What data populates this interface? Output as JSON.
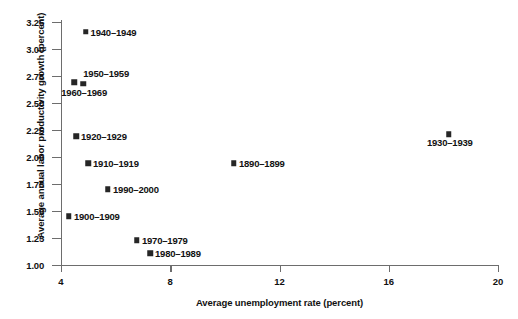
{
  "chart_data": {
    "type": "scatter",
    "title": "",
    "xlabel": "Average unemployment rate (percent)",
    "ylabel": "Average annual labor productivity growth (percent)",
    "xlim": [
      4,
      20
    ],
    "ylim": [
      1.0,
      3.25
    ],
    "xticks": [
      "4",
      "8",
      "12",
      "16",
      "20"
    ],
    "xtick_values": [
      4,
      8,
      12,
      16,
      20
    ],
    "yticks": [
      "1.00",
      "1.25",
      "1.50",
      "1.75",
      "2.00",
      "2.25",
      "2.50",
      "2.75",
      "3.00",
      "3.25"
    ],
    "ytick_values": [
      1.0,
      1.25,
      1.5,
      1.75,
      2.0,
      2.25,
      2.5,
      2.75,
      3.0,
      3.25
    ],
    "grid": false,
    "legend": "none",
    "marker": "square",
    "marker_color": "#262626",
    "axis_color": "#6d6d6d",
    "points": [
      {
        "label": "1940–1949",
        "x": 4.9,
        "y": 3.16,
        "label_pos": "right"
      },
      {
        "label": "1950–1959",
        "x": 4.48,
        "y": 2.69,
        "label_pos": "above"
      },
      {
        "label": "1960–1969",
        "x": 4.81,
        "y": 2.68,
        "label_pos": "below"
      },
      {
        "label": "1920–1929",
        "x": 4.55,
        "y": 2.19,
        "label_pos": "right"
      },
      {
        "label": "1910–1919",
        "x": 4.99,
        "y": 1.94,
        "label_pos": "right"
      },
      {
        "label": "1990–2000",
        "x": 5.72,
        "y": 1.7,
        "label_pos": "right"
      },
      {
        "label": "1900–1909",
        "x": 4.29,
        "y": 1.45,
        "label_pos": "right"
      },
      {
        "label": "1970–1979",
        "x": 6.78,
        "y": 1.23,
        "label_pos": "right"
      },
      {
        "label": "1980–1989",
        "x": 7.26,
        "y": 1.11,
        "label_pos": "right"
      },
      {
        "label": "1890–1899",
        "x": 10.33,
        "y": 1.94,
        "label_pos": "right"
      },
      {
        "label": "1930–1939",
        "x": 18.2,
        "y": 2.21,
        "label_pos": "below"
      }
    ]
  }
}
